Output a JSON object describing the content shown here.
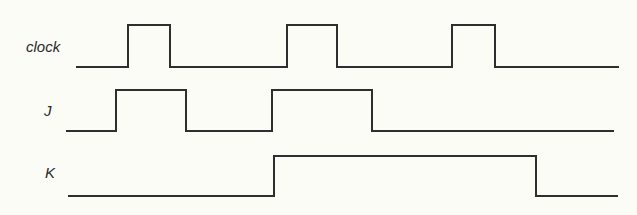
{
  "diagram": {
    "type": "timing-diagram",
    "signals": [
      {
        "name": "clock",
        "label": "clock",
        "initial_level": 0,
        "transitions": [
          {
            "t": 128,
            "level": 1
          },
          {
            "t": 170,
            "level": 0
          },
          {
            "t": 287,
            "level": 1
          },
          {
            "t": 337,
            "level": 0
          },
          {
            "t": 452,
            "level": 1
          },
          {
            "t": 495,
            "level": 0
          }
        ],
        "t_start": 77,
        "t_end": 618
      },
      {
        "name": "J",
        "label": "J",
        "initial_level": 0,
        "transitions": [
          {
            "t": 116,
            "level": 1
          },
          {
            "t": 186,
            "level": 0
          },
          {
            "t": 272,
            "level": 1
          },
          {
            "t": 372,
            "level": 0
          }
        ],
        "t_start": 67,
        "t_end": 613
      },
      {
        "name": "K",
        "label": "K",
        "initial_level": 0,
        "transitions": [
          {
            "t": 274,
            "level": 1
          },
          {
            "t": 536,
            "level": 0
          }
        ],
        "t_start": 69,
        "t_end": 617
      }
    ]
  },
  "colors": {
    "background": "#fcfcf7",
    "line": "#2e2e2e",
    "label": "#2a2a2a"
  }
}
